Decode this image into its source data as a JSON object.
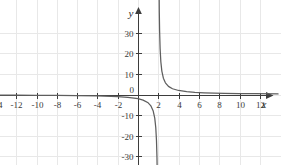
{
  "chart_data": {
    "type": "line",
    "title": "",
    "subtitle": "",
    "xlabel": "x",
    "ylabel": "y",
    "xlim": [
      -15.2,
      13.8
    ],
    "ylim": [
      -36,
      36
    ],
    "grid": true,
    "legend": null,
    "function_label": "y = 4/(x - 2)",
    "asymptotes": {
      "vertical": 2,
      "horizontal": 0
    },
    "x_ticks": [
      -14,
      -12,
      -10,
      -8,
      -6,
      -4,
      -2,
      2,
      4,
      6,
      8,
      10,
      12
    ],
    "x_tick_labels": [
      "-14",
      "-12",
      "-10",
      "-8",
      "-6",
      "-4",
      "-2",
      "2",
      "4",
      "6",
      "8",
      "10",
      "12"
    ],
    "y_ticks": [
      30,
      20,
      10,
      -10,
      -20,
      -30
    ],
    "y_tick_labels": [
      "30",
      "20",
      "10",
      "-10",
      "-20",
      "-30"
    ],
    "origin_label": "0",
    "series": [
      {
        "name": "left-branch",
        "x": [
          -15.2,
          -14,
          -12,
          -10,
          -8,
          -6,
          -4,
          -2,
          -1,
          0,
          0.5,
          1,
          1.25,
          1.5,
          1.65,
          1.75,
          1.82,
          1.87,
          1.9,
          1.93,
          1.95,
          1.965,
          1.975,
          1.983,
          1.99
        ],
        "y": [
          -0.233,
          -0.25,
          -0.286,
          -0.333,
          -0.4,
          -0.5,
          -0.667,
          -1.0,
          -1.333,
          -2.0,
          -2.667,
          -4.0,
          -5.333,
          -8.0,
          -11.43,
          -16.0,
          -22.22,
          -30.77,
          -40.0,
          -57.1,
          -80.0,
          -114.3,
          -160.0,
          -235.3,
          -400.0
        ]
      },
      {
        "name": "right-branch",
        "x": [
          2.01,
          2.017,
          2.025,
          2.035,
          2.05,
          2.07,
          2.1,
          2.13,
          2.18,
          2.25,
          2.35,
          2.5,
          2.7,
          3.0,
          3.4,
          4.0,
          4.8,
          5.6,
          6.5,
          7.5,
          8.5,
          10,
          11.5,
          13.8
        ],
        "y": [
          400.0,
          235.3,
          160.0,
          114.3,
          80.0,
          57.1,
          40.0,
          30.77,
          22.22,
          16.0,
          11.43,
          8.0,
          5.714,
          4.0,
          2.857,
          2.0,
          1.429,
          1.111,
          0.889,
          0.727,
          0.615,
          0.5,
          0.421,
          0.339
        ]
      }
    ],
    "grid_step_x": 2,
    "grid_step_y": 10,
    "colors": {
      "background": "#ffffff",
      "grid": "#e6e6e6",
      "axis": "#3d3d3d",
      "curve": "#5e5e5e",
      "tick_text": "#3a3a3a"
    }
  }
}
